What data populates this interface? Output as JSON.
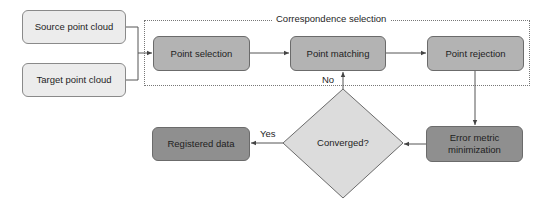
{
  "diagram": {
    "group": {
      "label": "Correspondence selection"
    },
    "nodes": {
      "source": {
        "label": "Source point cloud"
      },
      "target": {
        "label": "Target point cloud"
      },
      "point_selection": {
        "label": "Point selection"
      },
      "point_matching": {
        "label": "Point matching"
      },
      "point_rejection": {
        "label": "Point rejection"
      },
      "error_metric": {
        "label": "Error metric minimization"
      },
      "converged": {
        "label": "Converged?"
      },
      "registered": {
        "label": "Registered data"
      }
    },
    "edges": {
      "no_label": "No",
      "yes_label": "Yes"
    },
    "colors": {
      "input_fill": "#ececec",
      "process_fill": "#b3b3b3",
      "dark_fill": "#8f8f8f",
      "decision_fill": "#dcdcdc",
      "line": "#555555"
    }
  }
}
